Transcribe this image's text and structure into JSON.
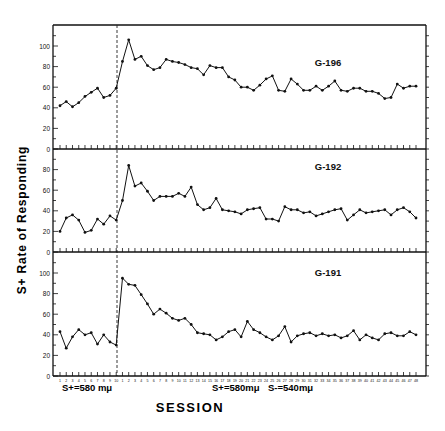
{
  "chart_data": {
    "type": "line",
    "title": "",
    "ylabel": "S+ Rate of Responding",
    "xlabel": "SESSION",
    "phase_labels": [
      {
        "text": "S+=580 mμ",
        "position": "baseline"
      },
      {
        "text": "S+=580mμ",
        "position": "discrimination"
      },
      {
        "text": "S-=540mμ",
        "position": "discrimination"
      }
    ],
    "phase_change_after_session": 10,
    "x_tick_labels_note": "Session labels printed under the x-axis are too small to read; indices below are approximate: 1-10 (baseline), then 1-48 (discrimination)",
    "baseline_sessions": [
      1,
      2,
      3,
      4,
      5,
      6,
      7,
      8,
      9,
      10
    ],
    "discrimination_sessions": [
      1,
      2,
      3,
      4,
      5,
      6,
      7,
      8,
      9,
      10,
      11,
      12,
      13,
      14,
      15,
      16,
      17,
      18,
      19,
      20,
      21,
      22,
      23,
      24,
      25,
      26,
      27,
      28,
      29,
      30,
      31,
      32,
      33,
      34,
      35,
      36,
      37,
      38,
      39,
      40,
      41,
      42,
      43,
      44,
      45,
      46,
      47,
      48
    ],
    "panels": [
      {
        "name": "G-196",
        "ylim": [
          0,
          120
        ],
        "yticks": [
          0,
          20,
          40,
          60,
          80,
          100
        ],
        "values": [
          42,
          46,
          41,
          45,
          51,
          55,
          59,
          50,
          52,
          59,
          85,
          106,
          87,
          90,
          81,
          77,
          79,
          87,
          85,
          84,
          82,
          79,
          78,
          72,
          81,
          79,
          79,
          70,
          67,
          60,
          60,
          57,
          62,
          68,
          71,
          57,
          56,
          68,
          63,
          57,
          57,
          61,
          57,
          61,
          66,
          57,
          56,
          59,
          59,
          56,
          56,
          54,
          49,
          50,
          63,
          59,
          61,
          61,
          56
        ]
      },
      {
        "name": "G-192",
        "ylim": [
          0,
          100
        ],
        "yticks": [
          0,
          20,
          40,
          60,
          80
        ],
        "values": [
          20,
          33,
          36,
          31,
          19,
          21,
          32,
          27,
          35,
          31,
          50,
          84,
          64,
          67,
          59,
          50,
          54,
          54,
          54,
          57,
          54,
          63,
          46,
          41,
          43,
          52,
          41,
          40,
          39,
          37,
          41,
          42,
          43,
          32,
          32,
          30,
          44,
          41,
          41,
          38,
          39,
          35,
          37,
          39,
          41,
          42,
          31,
          36,
          41,
          38,
          39,
          40,
          41,
          36,
          41,
          43,
          39,
          33,
          38,
          38
        ]
      },
      {
        "name": "G-191",
        "ylim": [
          0,
          120
        ],
        "yticks": [
          0,
          20,
          40,
          60,
          80,
          100
        ],
        "values": [
          43,
          27,
          38,
          45,
          40,
          42,
          31,
          40,
          33,
          30,
          95,
          89,
          88,
          79,
          70,
          60,
          65,
          61,
          56,
          54,
          56,
          50,
          42,
          41,
          40,
          35,
          38,
          43,
          45,
          38,
          53,
          45,
          42,
          38,
          35,
          39,
          48,
          33,
          39,
          41,
          42,
          39,
          41,
          39,
          40,
          37,
          39,
          44,
          35,
          40,
          37,
          35,
          41,
          42,
          39,
          39,
          43,
          40
        ]
      }
    ],
    "grid": false,
    "legend": "none (panel labels inside plot)"
  }
}
